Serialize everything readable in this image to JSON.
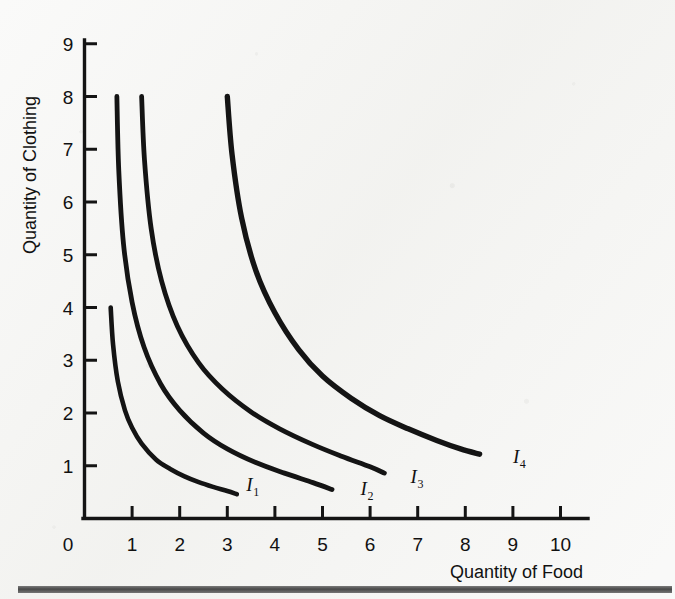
{
  "figure": {
    "background_color": "#f4f4f2",
    "ink_color": "#141414"
  },
  "axes": {
    "x_title": "Quantity of Food",
    "y_title": "Quantity of Clothing",
    "x_ticks": [
      "1",
      "2",
      "3",
      "4",
      "5",
      "6",
      "7",
      "8",
      "9",
      "10"
    ],
    "y_ticks": [
      "1",
      "2",
      "3",
      "4",
      "5",
      "6",
      "7",
      "8",
      "9"
    ],
    "origin_label": "0"
  },
  "curve_labels": [
    {
      "base": "I",
      "sub": "1"
    },
    {
      "base": "I",
      "sub": "2"
    },
    {
      "base": "I",
      "sub": "3"
    },
    {
      "base": "I",
      "sub": "4"
    }
  ],
  "footer": {
    "rule_color": "#3a3a3a"
  },
  "chart_data": {
    "type": "line",
    "xlabel": "Quantity of Food",
    "ylabel": "Quantity of Clothing",
    "xlim": [
      0,
      10.4
    ],
    "ylim": [
      0,
      9.4
    ],
    "grid": false,
    "legend": "inline-end-of-curve",
    "x_ticks": [
      1,
      2,
      3,
      4,
      5,
      6,
      7,
      8,
      9,
      10
    ],
    "y_ticks": [
      1,
      2,
      3,
      4,
      5,
      6,
      7,
      8,
      9
    ],
    "annotations": [
      {
        "text": "I1",
        "x": 3.4,
        "y": 0.52
      },
      {
        "text": "I2",
        "x": 5.8,
        "y": 0.45
      },
      {
        "text": "I3",
        "x": 6.85,
        "y": 0.68
      },
      {
        "text": "I4",
        "x": 9.0,
        "y": 1.05
      }
    ],
    "series": [
      {
        "name": "I1",
        "utility_constant": 1.5,
        "x": [
          0.55,
          0.6,
          0.7,
          0.85,
          1.0,
          1.2,
          1.5,
          1.8,
          2.1,
          2.4,
          2.7,
          3.0,
          3.2
        ],
        "y": [
          4.0,
          3.3,
          2.6,
          2.05,
          1.72,
          1.42,
          1.12,
          0.94,
          0.8,
          0.69,
          0.6,
          0.52,
          0.46
        ]
      },
      {
        "name": "I2",
        "utility_constant": 3.2,
        "x": [
          0.68,
          0.72,
          0.82,
          1.0,
          1.25,
          1.6,
          2.0,
          2.5,
          3.0,
          3.6,
          4.2,
          4.8,
          5.2
        ],
        "y": [
          8.0,
          6.6,
          5.2,
          4.1,
          3.25,
          2.55,
          2.05,
          1.62,
          1.32,
          1.06,
          0.86,
          0.68,
          0.55
        ]
      },
      {
        "name": "I3",
        "utility_constant": 4.4,
        "x": [
          1.2,
          1.26,
          1.4,
          1.62,
          1.95,
          2.4,
          2.9,
          3.5,
          4.1,
          4.8,
          5.4,
          6.0,
          6.3
        ],
        "y": [
          8.0,
          6.8,
          5.5,
          4.5,
          3.65,
          2.95,
          2.45,
          2.02,
          1.7,
          1.4,
          1.18,
          0.98,
          0.86
        ]
      },
      {
        "name": "I4",
        "utility_constant": 9.0,
        "x": [
          3.0,
          3.1,
          3.3,
          3.6,
          4.0,
          4.5,
          5.0,
          5.6,
          6.2,
          6.8,
          7.4,
          7.9,
          8.3
        ],
        "y": [
          8.0,
          6.9,
          5.7,
          4.7,
          3.9,
          3.2,
          2.7,
          2.28,
          1.95,
          1.7,
          1.48,
          1.32,
          1.22
        ]
      }
    ]
  }
}
